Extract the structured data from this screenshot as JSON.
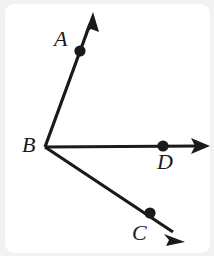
{
  "figure": {
    "background_color": "#f2f2f2",
    "paper_color": "#ffffff",
    "stroke_color": "#1a1a1a",
    "labels": {
      "a": "A",
      "b": "B",
      "c": "C",
      "d": "D"
    },
    "geometry": {
      "vertex": {
        "name": "B",
        "x": 45,
        "y": 147
      },
      "rays": [
        {
          "name": "ray-BA",
          "from": {
            "x": 45,
            "y": 147
          },
          "to": {
            "x": 93,
            "y": 16
          },
          "arrow_tip": {
            "x": 93,
            "y": 13
          },
          "point": {
            "name": "A",
            "x": 80,
            "y": 51
          }
        },
        {
          "name": "ray-BD",
          "from": {
            "x": 45,
            "y": 147
          },
          "to": {
            "x": 205,
            "y": 146
          },
          "arrow_tip": {
            "x": 209,
            "y": 146
          },
          "point": {
            "name": "D",
            "x": 163,
            "y": 146
          }
        },
        {
          "name": "ray-BC",
          "from": {
            "x": 45,
            "y": 147
          },
          "to": {
            "x": 178,
            "y": 236
          },
          "arrow_tip": {
            "x": 183,
            "y": 240
          },
          "point": {
            "name": "C",
            "x": 150,
            "y": 213
          }
        }
      ],
      "point_radius": 5.5,
      "line_width": 3.2
    }
  }
}
